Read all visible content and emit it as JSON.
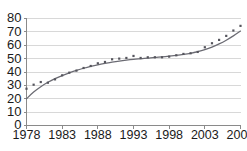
{
  "chart_data": {
    "type": "scatter",
    "title": "",
    "subtitle": "",
    "xlabel": "",
    "ylabel": "",
    "xlim": [
      1978,
      2008
    ],
    "ylim": [
      0,
      80
    ],
    "grid": true,
    "legend": false,
    "legend_position": "none",
    "y_ticks": [
      0,
      10,
      20,
      30,
      40,
      50,
      60,
      70,
      80
    ],
    "x_ticks": [
      1978,
      1983,
      1988,
      1993,
      1998,
      2003,
      2008
    ],
    "y_tick_labels": [
      "0",
      "10",
      "20",
      "30",
      "40",
      "50",
      "60",
      "70",
      "80"
    ],
    "x_tick_labels": [
      "1978",
      "1983",
      "1988",
      "1993",
      "1998",
      "2003",
      "2008"
    ],
    "series": [
      {
        "name": "observations",
        "marker": "square",
        "color": "#55555d",
        "x": [
          1978,
          1979,
          1980,
          1981,
          1982,
          1983,
          1984,
          1985,
          1986,
          1987,
          1988,
          1989,
          1990,
          1991,
          1992,
          1993,
          1994,
          1995,
          1996,
          1997,
          1998,
          1999,
          2000,
          2001,
          2002,
          2003,
          2004,
          2005,
          2006,
          2007,
          2008
        ],
        "values": [
          27.5,
          30.5,
          32.5,
          32.0,
          34.5,
          37.5,
          39.5,
          41.0,
          43.0,
          44.5,
          46.5,
          47.5,
          49.5,
          50.0,
          50.5,
          52.0,
          50.5,
          51.0,
          51.0,
          51.0,
          51.5,
          52.5,
          53.5,
          54.0,
          55.0,
          58.5,
          61.5,
          64.0,
          67.0,
          71.0,
          74.5
        ]
      },
      {
        "name": "fitted-curve",
        "marker": "none",
        "color": "#6b6b73",
        "x": [
          1978,
          1979,
          1980,
          1981,
          1982,
          1983,
          1984,
          1985,
          1986,
          1987,
          1988,
          1989,
          1990,
          1991,
          1992,
          1993,
          1994,
          1995,
          1996,
          1997,
          1998,
          1999,
          2000,
          2001,
          2002,
          2003,
          2004,
          2005,
          2006,
          2007,
          2008
        ],
        "values": [
          20.0,
          25.0,
          29.0,
          32.3,
          35.0,
          37.3,
          39.4,
          41.2,
          42.8,
          44.2,
          45.4,
          46.4,
          47.3,
          48.1,
          48.8,
          49.4,
          49.9,
          50.4,
          50.9,
          51.3,
          51.8,
          52.4,
          53.1,
          54.0,
          55.2,
          56.7,
          58.6,
          61.0,
          63.8,
          67.0,
          70.6
        ]
      }
    ]
  }
}
